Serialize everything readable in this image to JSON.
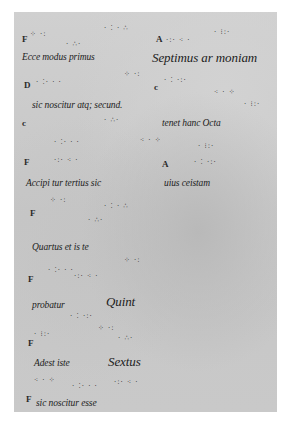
{
  "document": {
    "type": "medieval manuscript page with neumatic notation",
    "colors": {
      "background": "#ffffff",
      "parchment": "#c8c8c8",
      "ink": "#1c1c1c"
    },
    "lines": [
      {
        "clef": "F",
        "text": "Ecce modus primus",
        "text2": "Septimus ar moniam",
        "clef2": "A"
      },
      {
        "clef": "D",
        "text": "sic noscitur atq; secund.",
        "clef2": "c"
      },
      {
        "clef": "c",
        "text": "tenet hanc Octa"
      },
      {
        "clef": "F",
        "text": "Accipi tur tertius sic",
        "text2": "uius ceistam",
        "clef2": "A"
      },
      {
        "clef": "F",
        "text": "Quartus et is te"
      },
      {
        "clef": "F",
        "text": "probatur",
        "text2": "Quint"
      },
      {
        "clef": "F",
        "text": "Adest iste",
        "text2": "Sextus"
      },
      {
        "clef": "F",
        "text": "sic noscitur esse"
      }
    ],
    "neumes": {
      "a": "·  ∴·",
      "b": "· ⁚ ·  ∴",
      "c": "·:·  ⁖ ·",
      "d": "⁘ ·:",
      "e": "·  ⁚·  ·  ·",
      "f": "·  ⁚ ·:·",
      "g": "· ⁝:·",
      "h": "⁖ ·  ⁘"
    }
  }
}
